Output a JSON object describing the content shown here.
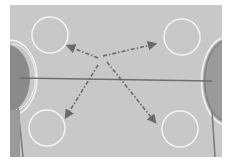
{
  "diagram": {
    "type": "rink-drill-diagram",
    "colors": {
      "page_background": "#ffffff",
      "rink_surface": "#c8c8c8",
      "circle_outline": "#f4f4f4",
      "center_line": "#6e6e6e",
      "board_line": "#7a7a7a",
      "crease_fill": "#8a8a8a",
      "crease_outline": "#f2f2f2",
      "arrow": "#6a6a6a"
    },
    "rink": {
      "x": 10,
      "y": 5,
      "width": 212,
      "height": 152
    },
    "center_line": {
      "x1": 20,
      "y1": 78,
      "x2": 212,
      "y2": 81
    },
    "circles": [
      {
        "id": "top-left",
        "cx": 50,
        "cy": 35,
        "r": 18
      },
      {
        "id": "top-right",
        "cx": 182,
        "cy": 37,
        "r": 18
      },
      {
        "id": "bottom-left",
        "cx": 47,
        "cy": 128,
        "r": 18
      },
      {
        "id": "bottom-right",
        "cx": 180,
        "cy": 129,
        "r": 18
      }
    ],
    "arrows": [
      {
        "id": "to-top-left",
        "x1": 98,
        "y1": 58,
        "x2": 68,
        "y2": 46
      },
      {
        "id": "to-top-right",
        "x1": 103,
        "y1": 56,
        "x2": 155,
        "y2": 44
      },
      {
        "id": "to-bottom-left",
        "x1": 98,
        "y1": 65,
        "x2": 66,
        "y2": 117
      },
      {
        "id": "to-bottom-right",
        "x1": 107,
        "y1": 62,
        "x2": 155,
        "y2": 122
      }
    ]
  }
}
